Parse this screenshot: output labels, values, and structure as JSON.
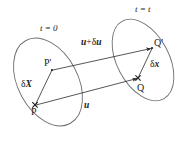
{
  "figure": {
    "type": "diagram",
    "background_color": "#ffffff",
    "stroke_color": "#3a3a3a",
    "text_color": "#1a1a1a",
    "width": 187,
    "height": 141
  },
  "configurations": [
    {
      "id": "reference",
      "label": "t = 0",
      "label_time_symbol": "t",
      "label_equals": " = ",
      "label_value": "0",
      "ellipse": {
        "cx": 48,
        "cy": 82,
        "rx": 30,
        "ry": 47,
        "rotate": -28
      }
    },
    {
      "id": "current",
      "label": "t = t",
      "label_time_symbol": "t",
      "label_equals": " = ",
      "label_value": "t",
      "ellipse": {
        "cx": 143,
        "cy": 60,
        "rx": 26,
        "ry": 44,
        "rotate": -28
      }
    }
  ],
  "points": [
    {
      "name": "P",
      "label": "P",
      "x": 35,
      "y": 105,
      "marker": "cross"
    },
    {
      "name": "Pp",
      "label": "P'",
      "x": 52,
      "y": 70,
      "marker": "dot"
    },
    {
      "name": "Q",
      "label": "Q",
      "x": 138,
      "y": 78,
      "marker": "cross"
    },
    {
      "name": "Qp",
      "label": "Q'",
      "x": 152,
      "y": 48,
      "marker": "dot"
    }
  ],
  "vectors": [
    {
      "id": "u",
      "label": "u",
      "label_parts": {
        "bold_italic": "u",
        "plain": ""
      },
      "from": "P",
      "to": "Q",
      "x1": 35,
      "y1": 105,
      "x2": 138,
      "y2": 78,
      "arrow": true
    },
    {
      "id": "u-plus-du",
      "label": "u + δu",
      "label_parts": {
        "bold_italic": "u",
        "plain": "+",
        "delta": "δ",
        "bold_italic2": "u"
      },
      "from": "Pp",
      "to": "Qp",
      "x1": 52,
      "y1": 70,
      "x2": 152,
      "y2": 48,
      "arrow": true
    },
    {
      "id": "deltaX",
      "label": "δX",
      "label_parts": {
        "delta": "δ",
        "bold_italic": "X"
      },
      "from": "P",
      "to": "Pp",
      "x1": 35,
      "y1": 105,
      "x2": 52,
      "y2": 70,
      "arrow": false
    },
    {
      "id": "deltax",
      "label": "δx",
      "label_parts": {
        "delta": "δ",
        "bold_italic": "x"
      },
      "from": "Q",
      "to": "Qp",
      "x1": 138,
      "y1": 78,
      "x2": 152,
      "y2": 48,
      "arrow": false
    }
  ],
  "labels": {
    "time_reference": "t = 0",
    "time_current": "t = t",
    "point_P": "P",
    "point_P_prime": "P'",
    "point_Q": "Q",
    "point_Q_prime": "Q'",
    "vector_u": "u",
    "vector_u_plus_du_plus": "+",
    "vector_u_plus_du_delta": "δ",
    "vector_u_plus_du_u2": "u",
    "vector_deltaX_delta": "δ",
    "vector_deltaX_sym": "X",
    "vector_deltax_delta": "δ",
    "vector_deltax_sym": "x"
  }
}
